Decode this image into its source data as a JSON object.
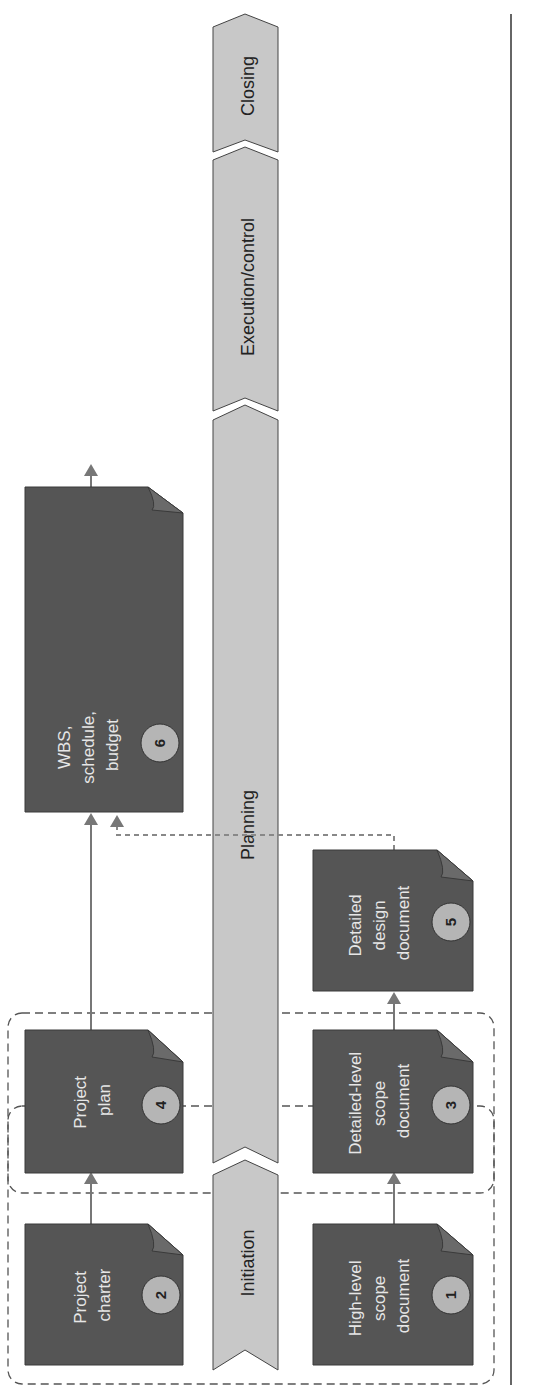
{
  "phases": [
    {
      "id": "initiation",
      "label": "Initiation"
    },
    {
      "id": "planning",
      "label": "Planning"
    },
    {
      "id": "execution",
      "label": "Execution/control"
    },
    {
      "id": "closing",
      "label": "Closing"
    }
  ],
  "documents": [
    {
      "number": "1",
      "lines": [
        "High-level",
        "scope",
        "document"
      ]
    },
    {
      "number": "2",
      "lines": [
        "Project",
        "charter"
      ]
    },
    {
      "number": "3",
      "lines": [
        "Detailed-level",
        "scope",
        "document"
      ]
    },
    {
      "number": "4",
      "lines": [
        "Project",
        "plan"
      ]
    },
    {
      "number": "5",
      "lines": [
        "Detailed",
        "design",
        "document"
      ]
    },
    {
      "number": "6",
      "lines": [
        "WBS,",
        "schedule,",
        "budget"
      ]
    }
  ],
  "colors": {
    "document_fill": "#555555",
    "phase_fill": "#c8c8c8",
    "badge_fill": "#b5b5b5",
    "arrow": "#777777"
  }
}
